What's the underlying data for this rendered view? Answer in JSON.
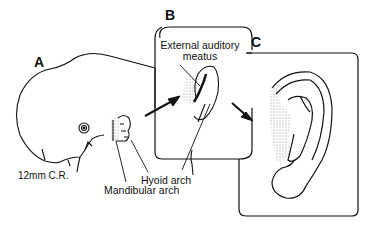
{
  "figure": {
    "panels": [
      {
        "id": "A",
        "letter": "A",
        "description": "12mm embryo, lateral view"
      },
      {
        "id": "B",
        "letter": "B",
        "description": "Developing external ear"
      },
      {
        "id": "C",
        "letter": "C",
        "description": "Adult external ear (auricle)"
      }
    ],
    "labels": {
      "external_auditory_meatus_line1": "External auditory",
      "external_auditory_meatus_line2": "meatus",
      "crown_rump": "12mm C.R.",
      "hyoid_arch": "Hyoid arch",
      "mandibular_arch": "Mandibular arch"
    },
    "colors": {
      "line": "#111111",
      "background": "#ffffff"
    }
  }
}
